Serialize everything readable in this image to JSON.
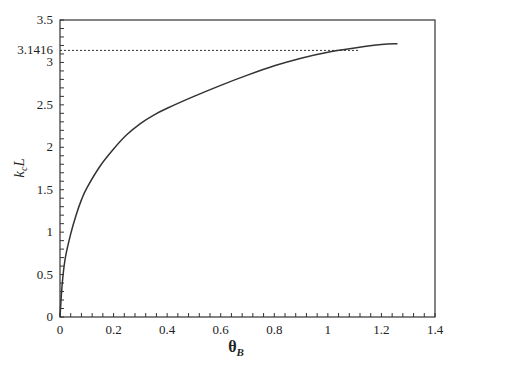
{
  "chart_data": {
    "type": "line",
    "title": "",
    "xlabel": "θB",
    "xlabel_main": "θ",
    "xlabel_sub": "B",
    "ylabel": "kcL",
    "ylabel_main_k": "k",
    "ylabel_sub": "c",
    "ylabel_main_L": "L",
    "xlim": [
      0,
      1.4
    ],
    "ylim": [
      0,
      3.5
    ],
    "grid": false,
    "legend": null,
    "x_ticks": [
      0,
      0.2,
      0.4,
      0.6,
      0.8,
      1,
      1.2,
      1.4
    ],
    "x_tick_labels": [
      "0",
      "0.2",
      "0.4",
      "0.6",
      "0.8",
      "1",
      "1.2",
      "1.4"
    ],
    "y_ticks": [
      0,
      0.5,
      1,
      1.5,
      2,
      2.5,
      3,
      3.5
    ],
    "y_tick_labels": [
      "0",
      "0.5",
      "1",
      "1.5",
      "2",
      "2.5",
      "3",
      "3.5"
    ],
    "annotations": [
      {
        "type": "hline",
        "y": 3.1416,
        "label": "3.1416",
        "style": "dotted",
        "x_range": [
          0,
          1.12
        ]
      }
    ],
    "series": [
      {
        "name": "kcL vs θB",
        "style": "solid",
        "x": [
          0,
          0.005,
          0.01,
          0.02,
          0.04,
          0.06,
          0.08,
          0.1,
          0.15,
          0.2,
          0.25,
          0.3,
          0.35,
          0.4,
          0.5,
          0.6,
          0.7,
          0.8,
          0.9,
          1.0,
          1.1,
          1.2,
          1.26
        ],
        "values": [
          0,
          0.25,
          0.45,
          0.7,
          0.98,
          1.2,
          1.38,
          1.52,
          1.78,
          1.98,
          2.15,
          2.28,
          2.38,
          2.46,
          2.6,
          2.73,
          2.85,
          2.96,
          3.05,
          3.12,
          3.17,
          3.21,
          3.22
        ]
      }
    ]
  }
}
